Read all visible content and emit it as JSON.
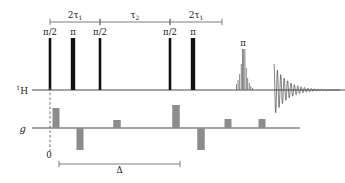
{
  "figure": {
    "type": "nmr-pulse-sequence-diagram",
    "colors": {
      "rf_pulse_black": "#111111",
      "gradient_gray": "#8c8c8c",
      "axis_line": "#4a4a4a",
      "bracket_line": "#6e6e6e",
      "text": "#1a1a1a",
      "background": "#ffffff"
    }
  },
  "channels": [
    {
      "id": "rf",
      "label": "H",
      "label_superscript": "1",
      "baseline_y": 90
    },
    {
      "id": "grad",
      "label": "g",
      "baseline_y": 128
    }
  ],
  "timing_brackets": {
    "top": [
      {
        "id": "tau1-first",
        "label": "2τ",
        "subscript": "1",
        "x_start": 50,
        "x_end": 100
      },
      {
        "id": "tau2",
        "label": "τ",
        "subscript": "2",
        "x_start": 100,
        "x_end": 170
      },
      {
        "id": "tau1-second",
        "label": "2τ",
        "subscript": "1",
        "x_start": 170,
        "x_end": 222
      }
    ],
    "bottom": [
      {
        "id": "delta",
        "label": "Δ",
        "x_start": 59,
        "x_end": 180
      }
    ]
  },
  "rf_pulses": [
    {
      "id": "p1",
      "label": "π/2",
      "x": 50,
      "width": 2.6,
      "height": 52,
      "flip_angle": "90"
    },
    {
      "id": "p2",
      "label": "π",
      "x": 73,
      "width": 4.4,
      "height": 52,
      "flip_angle": "180"
    },
    {
      "id": "p3",
      "label": "π/2",
      "x": 100,
      "width": 2.6,
      "height": 52,
      "flip_angle": "90"
    },
    {
      "id": "p4",
      "label": "π/2",
      "x": 170,
      "width": 2.6,
      "height": 52,
      "flip_angle": "90"
    },
    {
      "id": "p5",
      "label": "π",
      "x": 193,
      "width": 4.4,
      "height": 52,
      "flip_angle": "180"
    }
  ],
  "shaped_pulse": {
    "id": "selective-pi",
    "label": "π",
    "x_center": 243,
    "label_y": 46,
    "comb": [
      {
        "x": 236,
        "h": 6
      },
      {
        "x": 237.6,
        "h": 10
      },
      {
        "x": 239.2,
        "h": 16
      },
      {
        "x": 240.8,
        "h": 26
      },
      {
        "x": 242.0,
        "h": 41
      },
      {
        "x": 243.2,
        "h": 41
      },
      {
        "x": 244.4,
        "h": 41
      },
      {
        "x": 245.8,
        "h": 22
      },
      {
        "x": 247.2,
        "h": 12
      },
      {
        "x": 248.8,
        "h": 7
      },
      {
        "x": 250.4,
        "h": 4
      },
      {
        "x": 252.0,
        "h": 2
      }
    ]
  },
  "fid": {
    "id": "acquisition-fid",
    "x_start": 274,
    "x_end": 340,
    "initial_amplitude": 26,
    "decay_constant": 13,
    "period": 3.4,
    "label": ""
  },
  "gradient_pulses": [
    {
      "id": "g1",
      "x": 56,
      "width": 7,
      "amplitude": 20,
      "sign": "positive"
    },
    {
      "id": "g2",
      "x": 80,
      "width": 7,
      "amplitude": -22,
      "sign": "negative"
    },
    {
      "id": "g3",
      "x": 117,
      "width": 7.5,
      "amplitude": 8,
      "sign": "positive"
    },
    {
      "id": "g4",
      "x": 176,
      "width": 7.5,
      "amplitude": 23,
      "sign": "positive"
    },
    {
      "id": "g5",
      "x": 201,
      "width": 7.5,
      "amplitude": -22,
      "sign": "negative"
    },
    {
      "id": "g6",
      "x": 228,
      "width": 7,
      "amplitude": 9,
      "sign": "positive"
    },
    {
      "id": "g7",
      "x": 262,
      "width": 7,
      "amplitude": 9,
      "sign": "positive"
    }
  ],
  "origin_marker": {
    "id": "time-zero",
    "label": "0",
    "x": 50,
    "dashed_line_top": 88,
    "dashed_line_bottom": 152
  }
}
